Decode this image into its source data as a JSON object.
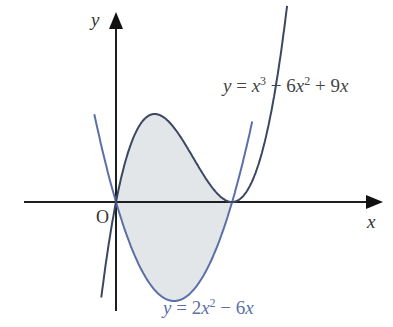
{
  "chart_data": {
    "type": "line",
    "title": "",
    "xlabel": "x",
    "ylabel": "y",
    "origin_label": "O",
    "grid": false,
    "series": [
      {
        "name": "y = x^3 - 6x^2 + 9x",
        "expr": "cubic",
        "coeffs": [
          1,
          -6,
          9,
          0
        ],
        "x_range": [
          -0.38,
          4.42
        ],
        "color": "#3b4763"
      },
      {
        "name": "y = 2x^2 - 6x",
        "expr": "quadratic",
        "coeffs": [
          2,
          -6,
          0
        ],
        "x_range": [
          -0.56,
          3.52
        ],
        "color": "#5b6fa8"
      }
    ],
    "intersections": [
      [
        0,
        0
      ],
      [
        3,
        0
      ]
    ],
    "shaded_region": {
      "between": [
        "y = x^3 - 6x^2 + 9x",
        "y = 2x^2 - 6x"
      ],
      "x_from": 0,
      "x_to": 3,
      "color": "#e3e6e9"
    }
  },
  "labels": {
    "y_axis": "y",
    "x_axis": "x",
    "origin": "O",
    "cubic": {
      "lhs": "y",
      "eq": " = ",
      "t1": "x",
      "e1": "3",
      "mid": " − 6",
      "t2": "x",
      "e2": "2",
      "tail": " + 9",
      "t3": "x"
    },
    "parabola": {
      "lhs": "y",
      "eq": " = 2",
      "t1": "x",
      "e1": "2",
      "mid": " − 6",
      "t2": "x"
    }
  },
  "layout": {
    "origin_px": [
      116,
      202
    ],
    "x_scale": 38.7,
    "y_scale": 22,
    "axis_color": "#1e1e1e"
  }
}
